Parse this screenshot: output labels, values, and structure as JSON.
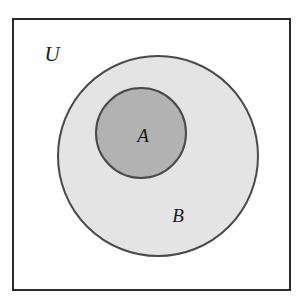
{
  "diagram": {
    "type": "venn-subset",
    "background_color": "#ffffff",
    "stroke_color": "#3a3a3a",
    "universe": {
      "label": "U",
      "shape": "rectangle",
      "fill_color": "#ffffff",
      "stroke_color": "#2b2b2b",
      "stroke_width": 2,
      "x": 13,
      "y": 19,
      "width": 277,
      "height": 271,
      "label_x": 52,
      "label_y": 61,
      "label_font_size": 21
    },
    "sets": [
      {
        "label": "B",
        "shape": "circle",
        "fill_color": "#e4e4e4",
        "stroke_color": "#4a4a4a",
        "stroke_width": 2,
        "cx": 158,
        "cy": 156,
        "r": 100,
        "label_x": 178,
        "label_y": 222,
        "label_font_size": 19
      },
      {
        "label": "A",
        "shape": "circle",
        "fill_color": "#b2b2b2",
        "stroke_color": "#4a4a4a",
        "stroke_width": 2,
        "cx": 141,
        "cy": 133,
        "r": 45,
        "label_x": 143,
        "label_y": 142,
        "label_font_size": 19
      }
    ]
  }
}
